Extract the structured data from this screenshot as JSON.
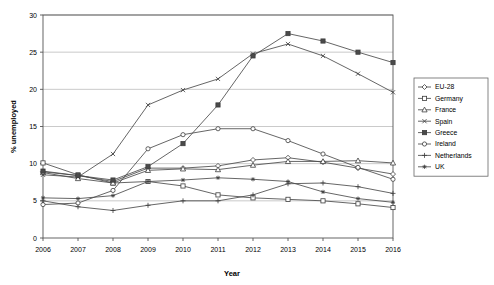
{
  "chart_data": {
    "type": "line",
    "title": "",
    "xlabel": "Year",
    "ylabel": "% unemployed",
    "x": [
      2006,
      2007,
      2008,
      2009,
      2010,
      2011,
      2012,
      2013,
      2014,
      2015,
      2016
    ],
    "xtick_labels": [
      "2006",
      "2007",
      "2008",
      "2009",
      "2010",
      "2011",
      "2012",
      "2013",
      "2014",
      "2015",
      "2016"
    ],
    "ytick_labels": [
      "0",
      "5",
      "10",
      "15",
      "20",
      "25",
      "30"
    ],
    "yticks": [
      0,
      5,
      10,
      15,
      20,
      25,
      30
    ],
    "ylim": [
      0,
      30
    ],
    "xlim": [
      2006,
      2016
    ],
    "grid": "horizontal",
    "legend_position": "right-outside",
    "series": [
      {
        "name": "EU-28",
        "marker": "diamond-open",
        "values": [
          8.9,
          8.4,
          7.6,
          9.4,
          9.4,
          9.7,
          10.5,
          10.8,
          10.2,
          9.4,
          8.6
        ]
      },
      {
        "name": "Germany",
        "marker": "square-open",
        "values": [
          10.1,
          8.5,
          7.4,
          7.6,
          7.0,
          5.8,
          5.4,
          5.2,
          5.0,
          4.6,
          4.1
        ]
      },
      {
        "name": "France",
        "marker": "triangle-open",
        "values": [
          8.8,
          8.0,
          7.4,
          9.1,
          9.3,
          9.2,
          9.8,
          10.3,
          10.3,
          10.4,
          10.1
        ]
      },
      {
        "name": "Spain",
        "marker": "cross-x",
        "values": [
          8.5,
          8.2,
          11.3,
          17.9,
          19.9,
          21.4,
          24.8,
          26.1,
          24.5,
          22.1,
          19.6
        ]
      },
      {
        "name": "Greece",
        "marker": "square-solid",
        "values": [
          9.0,
          8.4,
          7.8,
          9.6,
          12.7,
          17.9,
          24.5,
          27.5,
          26.5,
          25.0,
          23.6
        ]
      },
      {
        "name": "Ireland",
        "marker": "circle-open",
        "values": [
          4.5,
          4.7,
          6.4,
          12.0,
          13.9,
          14.7,
          14.7,
          13.1,
          11.3,
          9.5,
          7.9
        ]
      },
      {
        "name": "Netherlands",
        "marker": "plus",
        "values": [
          5.0,
          4.2,
          3.7,
          4.4,
          5.0,
          5.0,
          5.8,
          7.3,
          7.4,
          6.9,
          6.0
        ]
      },
      {
        "name": "UK",
        "marker": "star",
        "values": [
          5.4,
          5.3,
          5.7,
          7.6,
          7.8,
          8.1,
          7.9,
          7.6,
          6.2,
          5.3,
          4.8
        ]
      }
    ]
  },
  "legend": {
    "entries": [
      {
        "label": "EU-28"
      },
      {
        "label": "Germany"
      },
      {
        "label": "France"
      },
      {
        "label": "Spain"
      },
      {
        "label": "Greece"
      },
      {
        "label": "Ireland"
      },
      {
        "label": "Netherlands"
      },
      {
        "label": "UK"
      }
    ]
  },
  "colors": {
    "line": "#4a4a4a",
    "grid": "#b3b3b3",
    "axis": "#555555",
    "text": "#000000",
    "background": "#ffffff"
  }
}
